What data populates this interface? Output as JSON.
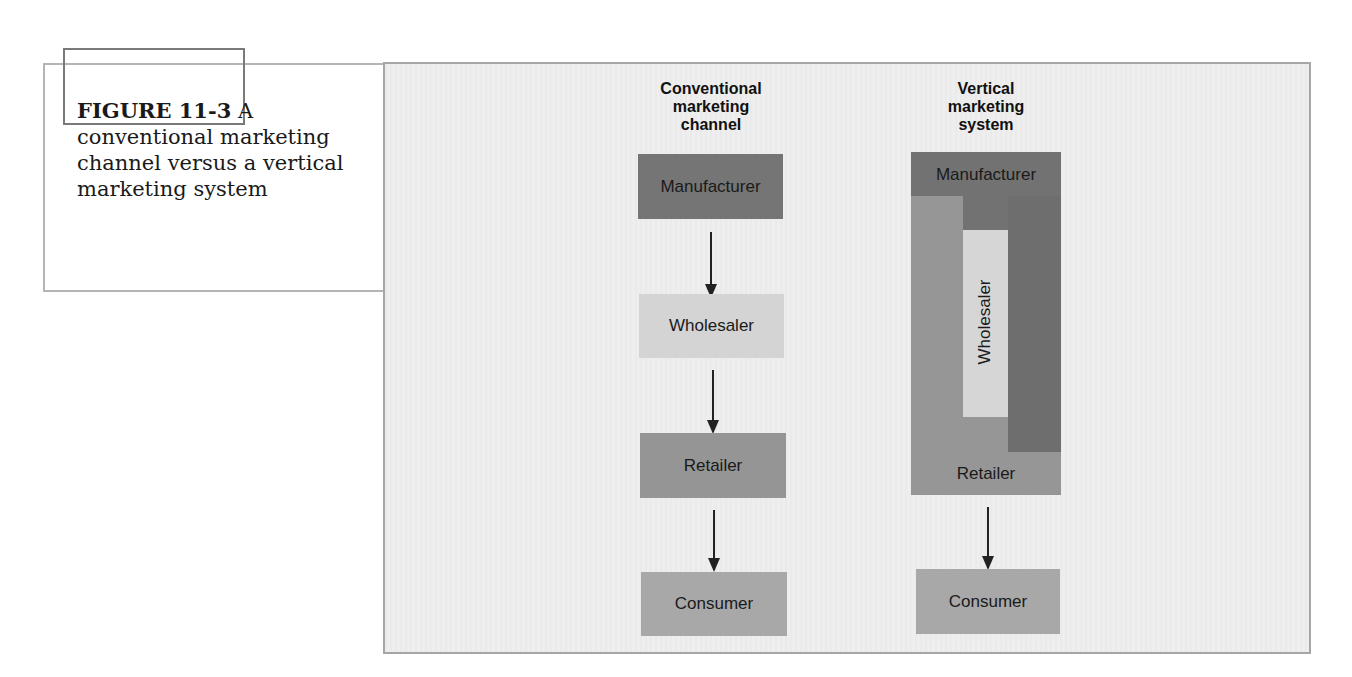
{
  "caption": {
    "figure_number": "FIGURE 11-3",
    "text": "A conventional marketing channel versus a vertical marketing system"
  },
  "colors": {
    "panel_bg": "#eeeeee",
    "manufacturer": "#757575",
    "wholesaler": "#d4d4d4",
    "retailer": "#959595",
    "consumer": "#a8a8a8",
    "vms_outer": "#969696",
    "vms_manufacturer_column": "#6e6e6e",
    "vms_wholesaler": "#d6d6d6"
  },
  "conventional": {
    "title": "Conventional marketing channel",
    "title_lines": [
      "Conventional",
      "marketing",
      "channel"
    ],
    "steps": [
      {
        "label": "Manufacturer"
      },
      {
        "label": "Wholesaler"
      },
      {
        "label": "Retailer"
      },
      {
        "label": "Consumer"
      }
    ]
  },
  "vertical": {
    "title": "Vertical marketing system",
    "title_lines": [
      "Vertical",
      "marketing",
      "system"
    ],
    "system_members": {
      "manufacturer": "Manufacturer",
      "wholesaler": "Wholesaler",
      "retailer": "Retailer"
    },
    "consumer": "Consumer"
  }
}
